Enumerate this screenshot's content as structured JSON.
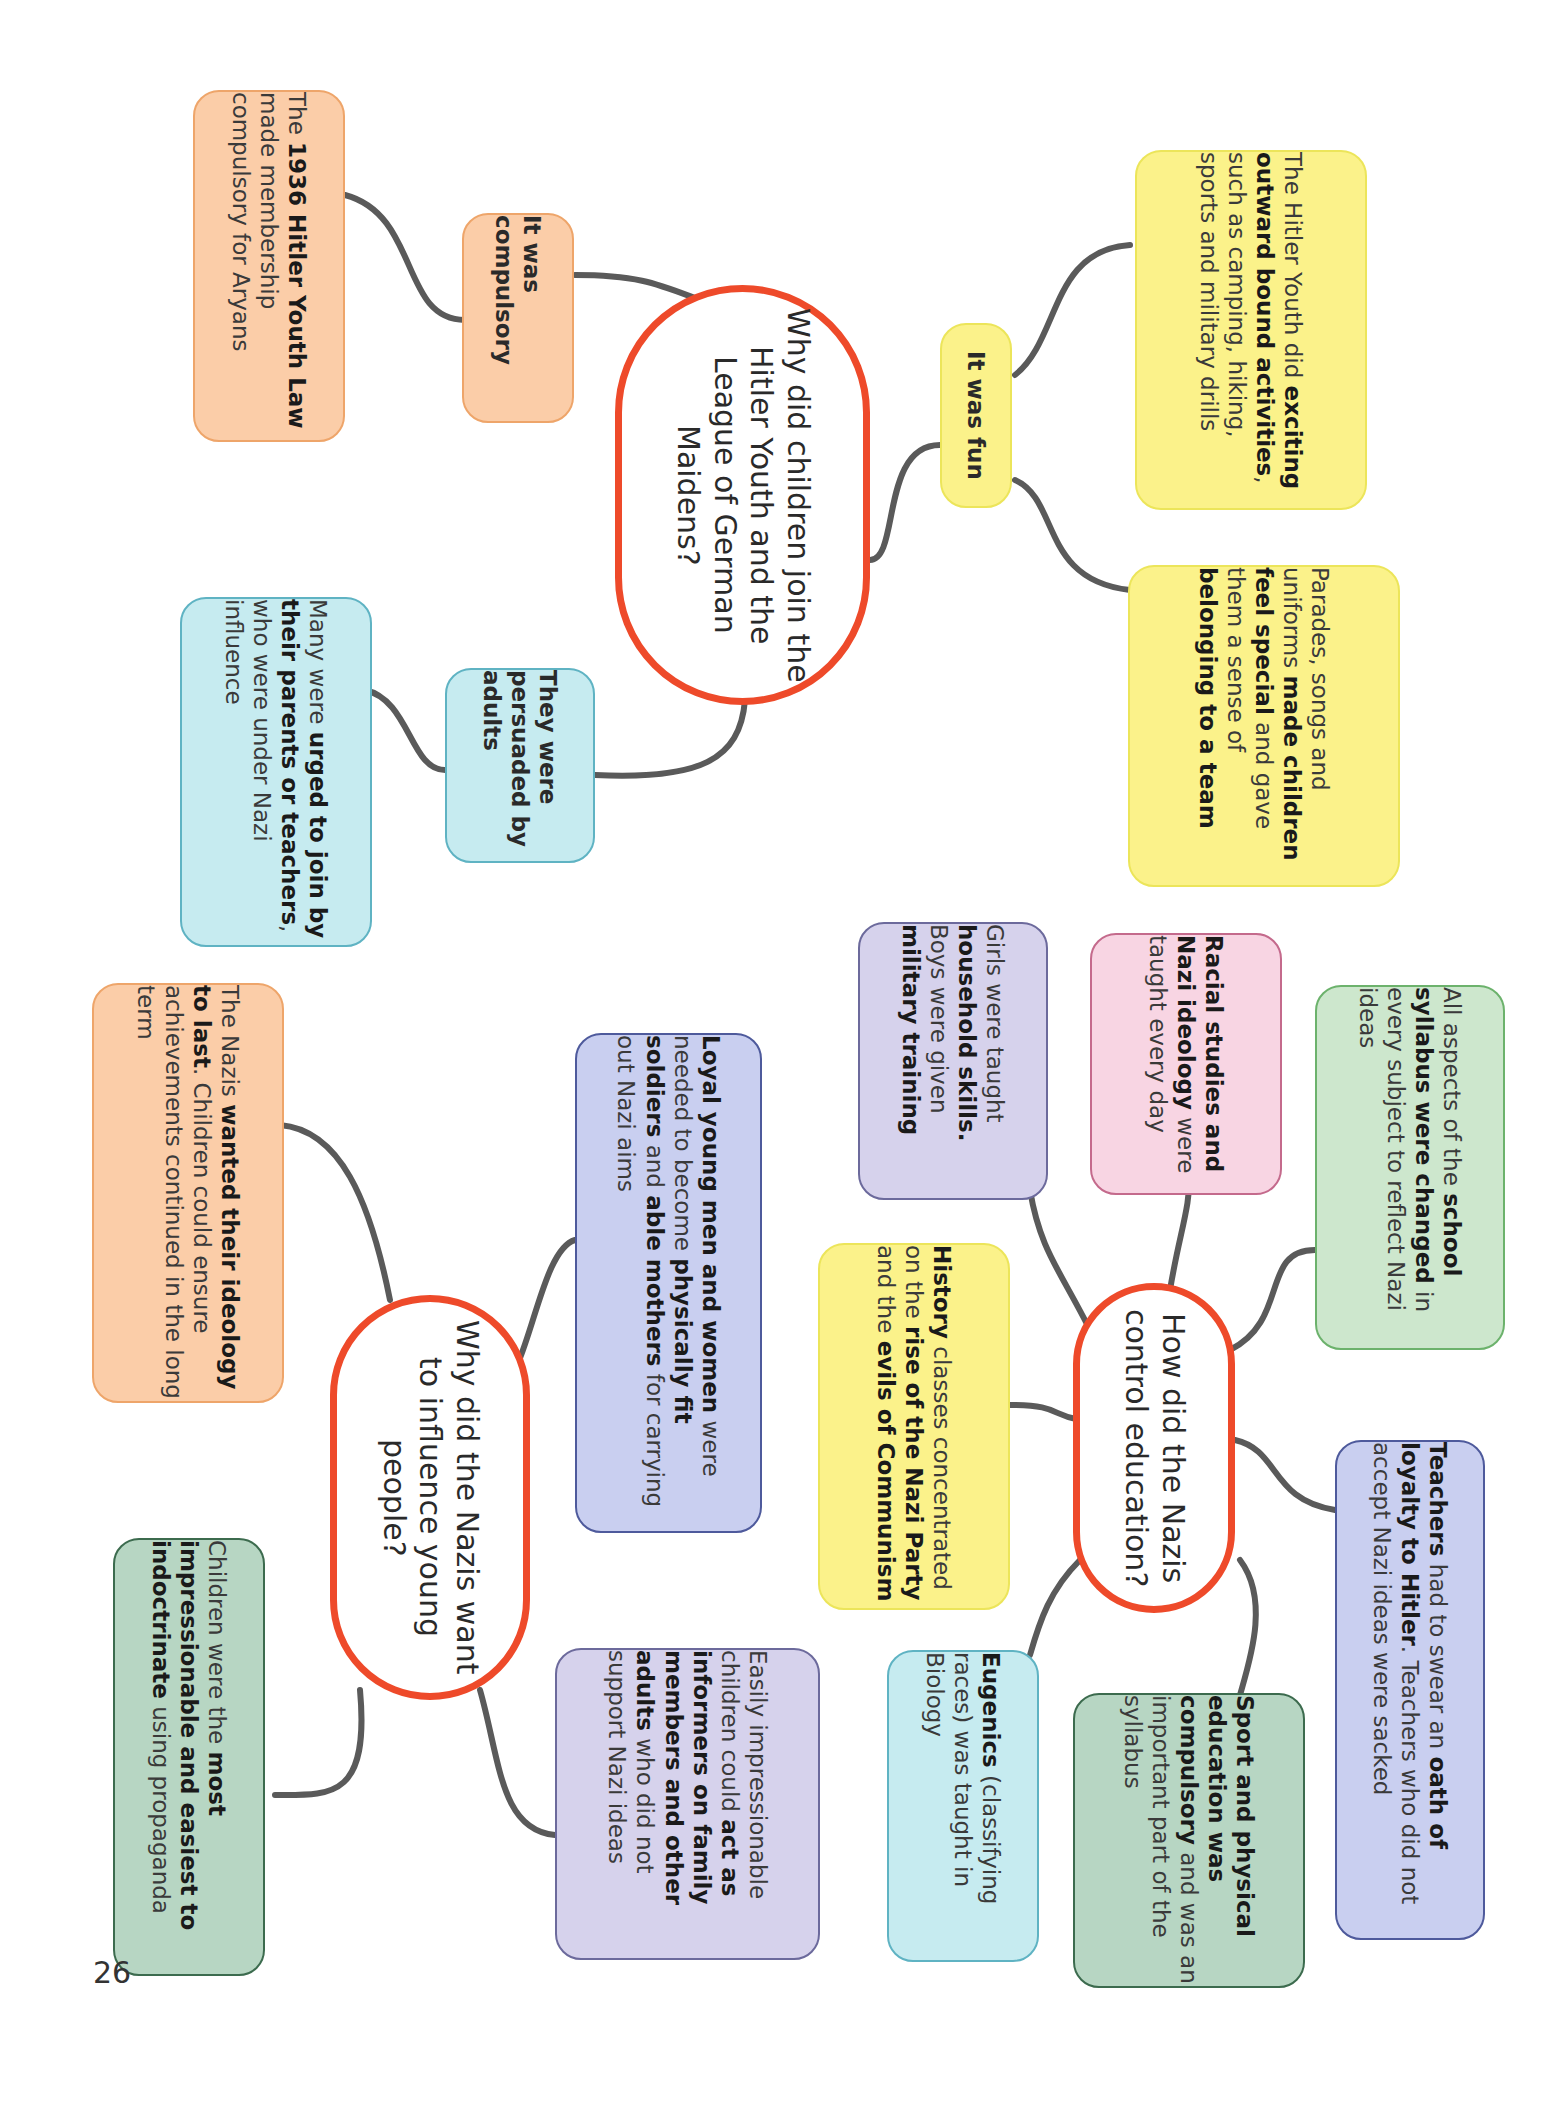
{
  "page_number": "26",
  "colors": {
    "center_border": "#ee4a2a",
    "connector": "#5a5a5a",
    "orange": "#fbcda8",
    "yellow": "#fbf28a",
    "cyan": "#c6ebf0",
    "purple": "#d6d2ec",
    "pink": "#f8d5e3",
    "green": "#cde7cd",
    "blue": "#c9cff0",
    "dark_green": "#b7d6c3"
  },
  "map1": {
    "center": "Why did children join the Hitler Youth and the League of German Maidens?",
    "compulsory": {
      "label": "It was compulsory",
      "detail": [
        {
          "t": "The ",
          "b": false
        },
        {
          "t": "1936 Hitler Youth Law",
          "b": true
        },
        {
          "t": " made membership compulsory for Aryans",
          "b": false
        }
      ]
    },
    "fun": {
      "label": "It was fun",
      "detail_activities": [
        {
          "t": "The Hitler Youth did ",
          "b": false
        },
        {
          "t": "exciting outward bound activities",
          "b": true
        },
        {
          "t": ", such as camping, hiking, sports and military drills",
          "b": false
        }
      ],
      "detail_belonging": [
        {
          "t": "Parades, songs and uniforms ",
          "b": false
        },
        {
          "t": "made children feel special",
          "b": true
        },
        {
          "t": " and gave them a sense of ",
          "b": false
        },
        {
          "t": "belonging to a team",
          "b": true
        }
      ]
    },
    "persuaded": {
      "label": "They were persuaded by adults",
      "detail": [
        {
          "t": "Many were ",
          "b": false
        },
        {
          "t": "urged to join by their parents or teachers",
          "b": true
        },
        {
          "t": ", who were under Nazi influence",
          "b": false
        }
      ]
    }
  },
  "map2": {
    "center": "How did the Nazis control education?",
    "nodes": {
      "household": [
        {
          "t": "Girls were taught ",
          "b": false
        },
        {
          "t": "household skills.",
          "b": true
        },
        {
          "t": " Boys were given ",
          "b": false
        },
        {
          "t": "military training",
          "b": true
        }
      ],
      "racial": [
        {
          "t": "Racial studies and Nazi ideology",
          "b": true
        },
        {
          "t": " were taught every day",
          "b": false
        }
      ],
      "syllabus": [
        {
          "t": "All aspects of the ",
          "b": false
        },
        {
          "t": "school syllabus were changed",
          "b": true
        },
        {
          "t": " in every subject to reflect Nazi ideas",
          "b": false
        }
      ],
      "history": [
        {
          "t": "History",
          "b": true
        },
        {
          "t": " classes concentrated on the ",
          "b": false
        },
        {
          "t": "rise of the Nazi Party",
          "b": true
        },
        {
          "t": " and the ",
          "b": false
        },
        {
          "t": "evils of Communism",
          "b": true
        }
      ],
      "teachers": [
        {
          "t": "Teachers",
          "b": true
        },
        {
          "t": " had to swear an ",
          "b": false
        },
        {
          "t": "oath of loyalty to Hitler",
          "b": true
        },
        {
          "t": ". Teachers who did not accept Nazi ideas were sacked",
          "b": false
        }
      ],
      "eugenics": [
        {
          "t": "Eugenics",
          "b": true
        },
        {
          "t": " (classifying races) was taught in Biology",
          "b": false
        }
      ],
      "sport": [
        {
          "t": "Sport and physical education was compulsory",
          "b": true
        },
        {
          "t": " and was an important part of the syllabus",
          "b": false
        }
      ]
    }
  },
  "map3": {
    "center": "Why did the Nazis want to influence young people?",
    "nodes": {
      "ideology": [
        {
          "t": "The Nazis ",
          "b": false
        },
        {
          "t": "wanted their ideology to last",
          "b": true
        },
        {
          "t": ". Children could ensure achievements continued in the long term",
          "b": false
        }
      ],
      "loyal": [
        {
          "t": "Loyal young men and women",
          "b": true
        },
        {
          "t": " were needed to become ",
          "b": false
        },
        {
          "t": "physically fit soldiers",
          "b": true
        },
        {
          "t": " and ",
          "b": false
        },
        {
          "t": "able mothers",
          "b": true
        },
        {
          "t": " for carrying out Nazi aims",
          "b": false
        }
      ],
      "impressionable": [
        {
          "t": "Children were the ",
          "b": false
        },
        {
          "t": "most impressionable and easiest to indoctrinate",
          "b": true
        },
        {
          "t": " using propaganda",
          "b": false
        }
      ],
      "informers": [
        {
          "t": "Easily impressionable children could ",
          "b": false
        },
        {
          "t": "act as informers on family members and other adults",
          "b": true
        },
        {
          "t": " who did not support Nazi ideas",
          "b": false
        }
      ]
    }
  }
}
